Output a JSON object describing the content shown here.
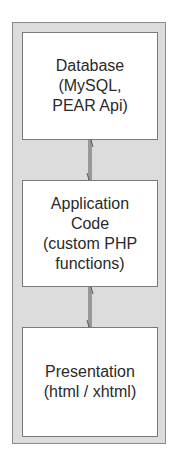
{
  "diagram": {
    "title": "",
    "layers": [
      {
        "name": "database",
        "lines": [
          "Database",
          "(MySQL,",
          "PEAR Api)"
        ]
      },
      {
        "name": "application",
        "lines": [
          "Application",
          "Code",
          "(custom PHP",
          "functions)"
        ]
      },
      {
        "name": "presentation",
        "lines": [
          "Presentation",
          "(html / xhtml)"
        ]
      }
    ],
    "connectors": [
      {
        "from": "database",
        "to": "application",
        "type": "bidirectional-arrow"
      },
      {
        "from": "application",
        "to": "presentation",
        "type": "bidirectional-arrow"
      }
    ],
    "colors": {
      "container_fill": "#dcdcdc",
      "container_border": "#8a8a8a",
      "box_fill": "#ffffff",
      "box_border": "#7a7a7a",
      "text": "#2a2a2a",
      "arrow": "#555555"
    }
  }
}
